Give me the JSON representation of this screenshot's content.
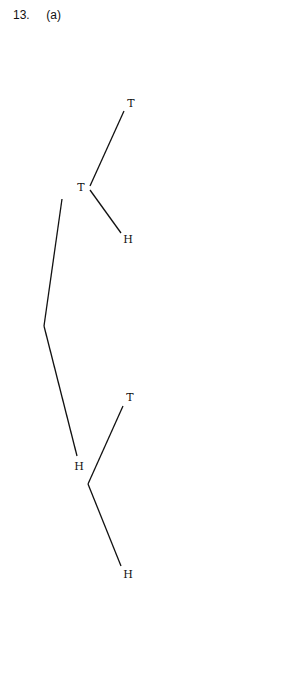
{
  "heading": {
    "number": "13.",
    "part": "(a)"
  },
  "tree": {
    "root": {
      "x": 44,
      "y": 326
    },
    "nodes": [
      {
        "id": "L1T",
        "label": "T",
        "x": 81,
        "y": 188,
        "vx": 90,
        "vy": 188
      },
      {
        "id": "L1H",
        "label": "H",
        "x": 79,
        "y": 466,
        "vx": 88,
        "vy": 484
      },
      {
        "id": "L2TT",
        "label": "T",
        "x": 131,
        "y": 104,
        "vx": 137,
        "vy": 88
      },
      {
        "id": "L2TH",
        "label": "H",
        "x": 129,
        "y": 240,
        "vx": 135,
        "vy": 246
      },
      {
        "id": "L2HT",
        "label": "T",
        "x": 131,
        "y": 398,
        "vx": 137,
        "vy": 398
      },
      {
        "id": "L2HH",
        "label": "H",
        "x": 128,
        "y": 575,
        "vx": 135,
        "vy": 575
      },
      {
        "id": "L3a",
        "label": "T",
        "x": 177,
        "y": 59,
        "vx": 182,
        "vy": 59
      },
      {
        "id": "L3b",
        "label": "H",
        "x": 178,
        "y": 115,
        "vx": 184,
        "vy": 115
      },
      {
        "id": "L3c",
        "label": "T",
        "x": 177,
        "y": 276,
        "vx": 182,
        "vy": 276
      },
      {
        "id": "L3d",
        "label": "H",
        "x": 178,
        "y": 302,
        "vx": 184,
        "vy": 302
      },
      {
        "id": "L3e",
        "label": "T",
        "x": 177,
        "y": 368,
        "vx": 182,
        "vy": 368
      },
      {
        "id": "L3f",
        "label": "H",
        "x": 178,
        "y": 427,
        "vx": 184,
        "vy": 427
      },
      {
        "id": "L3g",
        "label": "T",
        "x": 177,
        "y": 550,
        "vx": 182,
        "vy": 550
      },
      {
        "id": "L3h",
        "label": "H",
        "x": 178,
        "y": 612,
        "vx": 184,
        "vy": 612
      },
      {
        "id": "L4a",
        "label": "T",
        "x": 223,
        "y": 40,
        "vx": 228,
        "vy": 40
      },
      {
        "id": "L4b",
        "label": "H",
        "x": 224,
        "y": 76,
        "vx": 230,
        "vy": 76
      },
      {
        "id": "L4c",
        "label": "T",
        "x": 223,
        "y": 107,
        "vx": 228,
        "vy": 107
      },
      {
        "id": "L4d",
        "label": "H",
        "x": 224,
        "y": 140,
        "vx": 230,
        "vy": 140
      },
      {
        "id": "L4e",
        "label": "T",
        "x": 223,
        "y": 223,
        "vx": 228,
        "vy": 223
      },
      {
        "id": "L4f",
        "label": "H",
        "x": 224,
        "y": 259,
        "vx": 230,
        "vy": 259
      },
      {
        "id": "L4g",
        "label": "T",
        "x": 223,
        "y": 290,
        "vx": 228,
        "vy": 290
      },
      {
        "id": "L4h",
        "label": "H",
        "x": 224,
        "y": 324,
        "vx": 230,
        "vy": 324
      },
      {
        "id": "L4i",
        "label": "T",
        "x": 223,
        "y": 350,
        "vx": 228,
        "vy": 350
      },
      {
        "id": "L4j",
        "label": "H",
        "x": 224,
        "y": 385,
        "vx": 230,
        "vy": 385
      },
      {
        "id": "L4k",
        "label": "a",
        "x": 223,
        "y": 417,
        "vx": 228,
        "vy": 419
      },
      {
        "id": "L4l",
        "label": "H",
        "x": 224,
        "y": 452,
        "vx": 230,
        "vy": 452
      },
      {
        "id": "L4m",
        "label": "T",
        "x": 223,
        "y": 535,
        "vx": 228,
        "vy": 537
      },
      {
        "id": "L4n",
        "label": "H",
        "x": 224,
        "y": 570,
        "vx": 230,
        "vy": 570
      },
      {
        "id": "L4o",
        "label": "T",
        "x": 223,
        "y": 600,
        "vx": 228,
        "vy": 602
      },
      {
        "id": "L4p",
        "label": "H",
        "x": 224,
        "y": 637,
        "vx": 230,
        "vy": 637
      }
    ],
    "leaves": [
      [
        "T",
        "H"
      ],
      [
        "T",
        "H"
      ],
      [
        "T",
        "H"
      ],
      [
        "T",
        "H"
      ],
      [
        "T",
        "H"
      ],
      [
        "T",
        "H"
      ],
      [
        "T",
        "b"
      ],
      [
        "T",
        "H"
      ],
      [
        "T",
        "H"
      ],
      [
        "T",
        "H"
      ],
      [
        "T",
        "H"
      ],
      [
        "T",
        "H"
      ],
      [
        "T",
        "H"
      ],
      [
        "T",
        "H"
      ],
      [
        "T",
        "H"
      ],
      [
        "T",
        "H"
      ]
    ]
  }
}
